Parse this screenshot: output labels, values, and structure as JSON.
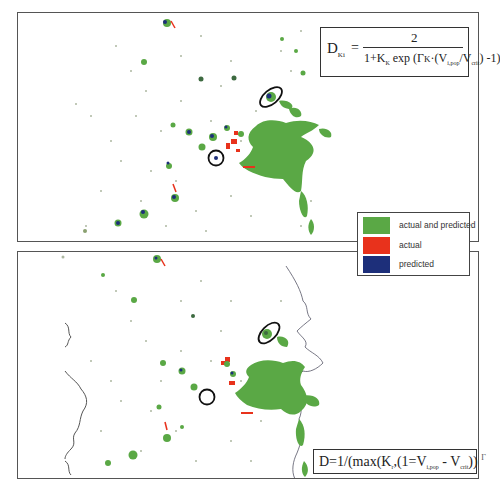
{
  "figure": {
    "panels": [
      {
        "id": "top",
        "description": "simulated vs actual urban map (model 1)",
        "formula": {
          "lhs": "D",
          "lhs_sub": "Ki",
          "equals": "=",
          "numerator": "2",
          "denominator_parts": [
            "1+K",
            "K",
            " exp ",
            "(",
            "Γ",
            "K",
            "·(",
            "V",
            "i,pop",
            "/",
            "V",
            "crit",
            ")",
            " -1)"
          ],
          "text": "D_Ki = 2 / (1 + K_K exp(Γ_K · (V_i,pop / V_crit) - 1))"
        },
        "markers": [
          {
            "type": "ellipse",
            "label": "cluster-northeast"
          },
          {
            "type": "circle",
            "label": "cluster-west"
          }
        ]
      },
      {
        "id": "bottom",
        "description": "simulated vs actual urban map (model 2)",
        "formula": {
          "text": "D=1/(max(K,(1=V_i,pop - V_crit)) Γ",
          "prefix": "D=1/(max(K",
          "k_sub": "r",
          "mid": ",(1=V",
          "v1_sub": "i,pop",
          "minus": " - V",
          "v2_sub": "crit",
          "suffix": "))",
          "gamma": "Γ"
        },
        "markers": [
          {
            "type": "ellipse",
            "label": "cluster-northeast"
          },
          {
            "type": "circle",
            "label": "cluster-west"
          }
        ]
      }
    ],
    "legend": {
      "items": [
        {
          "label": "actual and predicted",
          "color": "#5aa845"
        },
        {
          "label": "actual",
          "color": "#e8321c"
        },
        {
          "label": "predicted",
          "color": "#1d2f7a"
        }
      ]
    },
    "colors": {
      "border": "#555555",
      "coast": "#555555",
      "marker": "#111111"
    }
  }
}
